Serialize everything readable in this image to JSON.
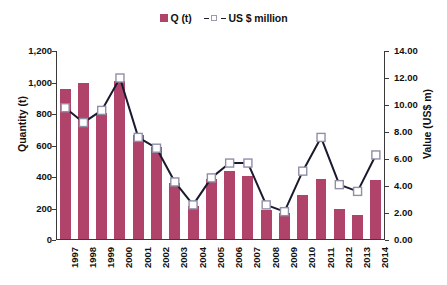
{
  "legend": {
    "position": "top-center",
    "entries": [
      {
        "label": "Q (t)",
        "type": "bar",
        "color": "#B0436A"
      },
      {
        "label": "US $ million",
        "type": "line",
        "color": "#1a1a2e",
        "marker": "open-square"
      }
    ]
  },
  "axes": {
    "y_left": {
      "title": "Quantity (t)",
      "min": 0,
      "max": 1200,
      "step": 200,
      "ticks": [
        "0",
        "200",
        "400",
        "600",
        "800",
        "1,000",
        "1,200"
      ]
    },
    "y_right": {
      "title": "Value (US$ m)",
      "min": 0,
      "max": 14,
      "step": 2,
      "ticks": [
        "0.00",
        "2.00",
        "4.00",
        "6.00",
        "8.00",
        "10.00",
        "12.00",
        "14.00"
      ]
    },
    "x": {
      "title": "",
      "ticks": [
        "1997",
        "1998",
        "1999",
        "2000",
        "2001",
        "2002",
        "2003",
        "2004",
        "2005",
        "2006",
        "2007",
        "2008",
        "2009",
        "2010",
        "2011",
        "2012",
        "2013",
        "2014"
      ]
    }
  },
  "chart_data": {
    "type": "bar",
    "title": "",
    "subtitle": "",
    "xlabel": "",
    "ylabel": "Quantity (t)",
    "y2label": "Value (US$ m)",
    "ylim": [
      0,
      1200
    ],
    "y2lim": [
      0,
      14
    ],
    "grid": false,
    "legend_position": "top-center",
    "categories": [
      "1997",
      "1998",
      "1999",
      "2000",
      "2001",
      "2002",
      "2003",
      "2004",
      "2005",
      "2006",
      "2007",
      "2008",
      "2009",
      "2010",
      "2011",
      "2012",
      "2013",
      "2014"
    ],
    "series": [
      {
        "name": "Q (t)",
        "type": "bar",
        "axis": "left",
        "unit": "t",
        "color": "#B0436A",
        "values": [
          950,
          990,
          800,
          1000,
          660,
          580,
          350,
          210,
          380,
          430,
          400,
          180,
          160,
          280,
          380,
          190,
          150,
          370
        ]
      },
      {
        "name": "US $ million",
        "type": "line",
        "axis": "right",
        "unit": "US$ million",
        "color": "#1a1a2e",
        "marker": "open-square",
        "line_style": "solid",
        "values": [
          9.8,
          8.7,
          9.6,
          12.0,
          7.6,
          6.8,
          4.3,
          2.6,
          4.6,
          5.7,
          5.7,
          2.6,
          2.1,
          5.1,
          7.6,
          4.1,
          3.6,
          6.3
        ]
      }
    ]
  }
}
